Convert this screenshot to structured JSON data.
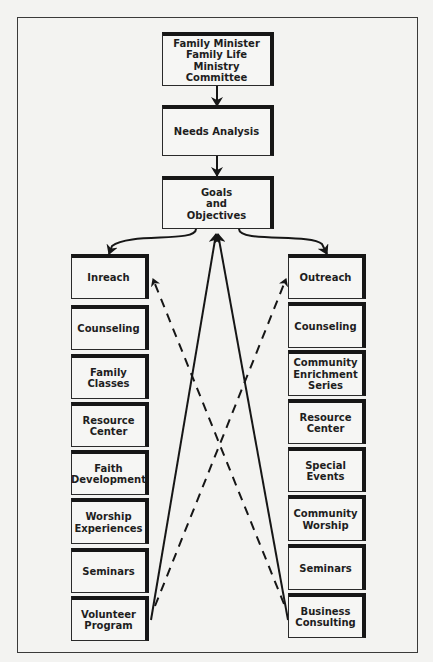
{
  "diagram": {
    "top": {
      "leader": "Family Minister\nFamily Life Ministry\nCommittee",
      "needs": "Needs Analysis",
      "goals": "Goals\nand\nObjectives"
    },
    "inreach": {
      "header": "Inreach",
      "items": [
        "Counseling",
        "Family\nClasses",
        "Resource\nCenter",
        "Faith\nDevelopment",
        "Worship\nExperiences",
        "Seminars",
        "Volunteer\nProgram"
      ]
    },
    "outreach": {
      "header": "Outreach",
      "items": [
        "Counseling",
        "Community\nEnrichment\nSeries",
        "Resource\nCenter",
        "Special\nEvents",
        "Community\nWorship",
        "Seminars",
        "Business\nConsulting"
      ]
    },
    "connectors": [
      {
        "from": "leader",
        "to": "needs",
        "style": "solid"
      },
      {
        "from": "needs",
        "to": "goals",
        "style": "solid"
      },
      {
        "from": "goals",
        "to": "inreach",
        "style": "solid-curved"
      },
      {
        "from": "goals",
        "to": "outreach",
        "style": "solid-curved"
      },
      {
        "from": "volunteer-program",
        "to": "goals",
        "style": "solid"
      },
      {
        "from": "business-consulting",
        "to": "goals",
        "style": "solid"
      },
      {
        "from": "volunteer-program",
        "to": "outreach",
        "style": "dashed"
      },
      {
        "from": "business-consulting",
        "to": "inreach",
        "style": "dashed"
      }
    ]
  }
}
